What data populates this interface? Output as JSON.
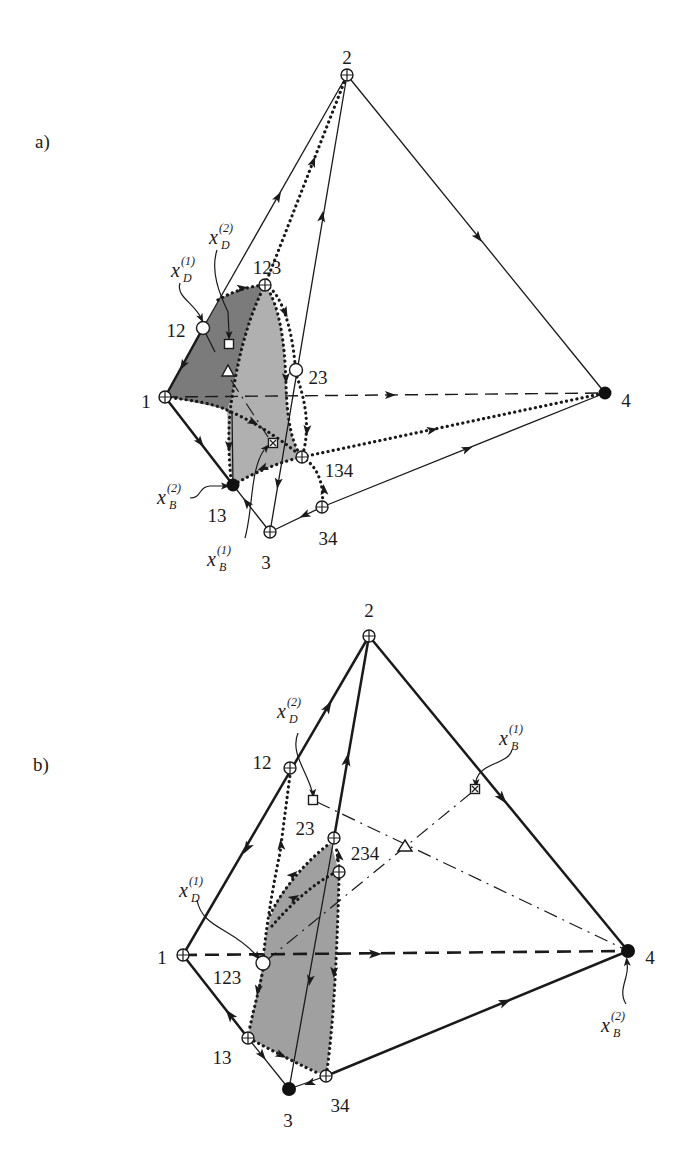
{
  "figure": {
    "colors": {
      "background": "#ffffff",
      "ink": "#1a1a1a",
      "region_dark": "#7b7b7b",
      "region_light": "#b0b0b0",
      "region_b": "#a0a0a0"
    },
    "panels": [
      {
        "label": "a)",
        "vertices": [
          {
            "label": "2",
            "marker": "circle-plus"
          },
          {
            "label": "12",
            "marker": "open-circle"
          },
          {
            "label": "123",
            "marker": "circle-plus"
          },
          {
            "label": "23",
            "marker": "open-circle"
          },
          {
            "label": "1",
            "marker": "circle-plus"
          },
          {
            "label": "4",
            "marker": "filled-circle"
          },
          {
            "label": "134",
            "marker": "circle-plus"
          },
          {
            "label": "13",
            "marker": "filled-circle"
          },
          {
            "label": "34",
            "marker": "circle-plus"
          },
          {
            "label": "3",
            "marker": "circle-plus"
          }
        ],
        "annotations": [
          {
            "base": "x",
            "sub": "D",
            "sup": "(2)",
            "points_to": "square-marker"
          },
          {
            "base": "x",
            "sub": "D",
            "sup": "(1)",
            "points_to": "vertex-12"
          },
          {
            "base": "x",
            "sub": "B",
            "sup": "(2)",
            "points_to": "vertex-13"
          },
          {
            "base": "x",
            "sub": "B",
            "sup": "(1)",
            "points_to": "boxed-cross-marker"
          }
        ],
        "extra_markers": [
          "square",
          "triangle",
          "boxed-cross"
        ]
      },
      {
        "label": "b)",
        "vertices": [
          {
            "label": "2",
            "marker": "circle-plus"
          },
          {
            "label": "12",
            "marker": "circle-plus"
          },
          {
            "label": "23",
            "marker": "circle-plus"
          },
          {
            "label": "234",
            "marker": "circle-plus"
          },
          {
            "label": "1",
            "marker": "circle-plus"
          },
          {
            "label": "123",
            "marker": "open-circle"
          },
          {
            "label": "4",
            "marker": "filled-circle"
          },
          {
            "label": "13",
            "marker": "circle-plus"
          },
          {
            "label": "34",
            "marker": "circle-plus"
          },
          {
            "label": "3",
            "marker": "filled-circle"
          }
        ],
        "annotations": [
          {
            "base": "x",
            "sub": "D",
            "sup": "(2)",
            "points_to": "square-marker"
          },
          {
            "base": "x",
            "sub": "B",
            "sup": "(1)",
            "points_to": "boxed-cross-marker"
          },
          {
            "base": "x",
            "sub": "D",
            "sup": "(1)",
            "points_to": "vertex-123"
          },
          {
            "base": "x",
            "sub": "B",
            "sup": "(2)",
            "points_to": "vertex-4"
          }
        ],
        "extra_markers": [
          "square",
          "triangle",
          "boxed-cross"
        ]
      }
    ]
  }
}
